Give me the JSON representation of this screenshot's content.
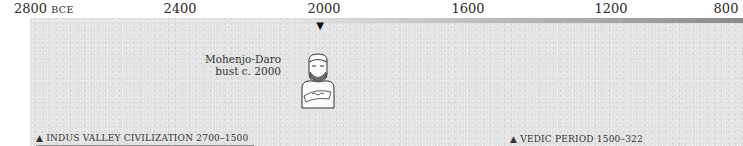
{
  "timeline": {
    "ticks": [
      {
        "label": "2800",
        "suffix": "BCE",
        "x": 32
      },
      {
        "label": "2400",
        "x": 180
      },
      {
        "label": "2000",
        "x": 324
      },
      {
        "label": "1600",
        "x": 468
      },
      {
        "label": "1200",
        "x": 611
      },
      {
        "label": "800",
        "x": 726
      }
    ],
    "marker": {
      "glyph": "▼",
      "year": "2000"
    },
    "artifact": {
      "caption_line1": "Mohenjo-Daro",
      "caption_line2": "bust c. 2000",
      "icon": "bust-figure-icon"
    },
    "periods": [
      {
        "glyph": "▲",
        "label": "INDUS VALLEY CIVILIZATION 2700–1500"
      },
      {
        "glyph": "▲",
        "label": "VEDIC PERIOD 1500–322"
      }
    ]
  }
}
